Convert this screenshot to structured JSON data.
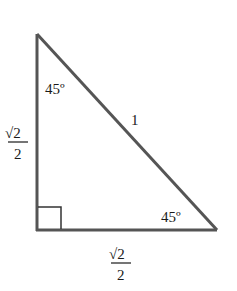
{
  "diagram": {
    "type": "right-triangle",
    "line_color": "#555555",
    "text_color": "#1a1a1a",
    "vertices": {
      "top": {
        "x": 37,
        "y": 34
      },
      "right_angle": {
        "x": 37,
        "y": 230
      },
      "right": {
        "x": 216,
        "y": 230
      }
    },
    "angles": {
      "top": "45º",
      "right": "45º",
      "right_angle_marker": true
    },
    "sides": {
      "hypotenuse": "1",
      "vertical_leg": {
        "numerator": "√2",
        "denominator": "2"
      },
      "horizontal_leg": {
        "numerator": "√2",
        "denominator": "2"
      }
    }
  }
}
